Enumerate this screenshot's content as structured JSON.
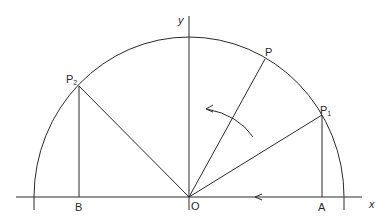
{
  "diagram": {
    "type": "unit-circle-rotation",
    "colors": {
      "line": "#2a2a2a",
      "background": "#ffffff"
    },
    "origin": {
      "label": "O",
      "x": 189,
      "y": 197
    },
    "axes": {
      "x": {
        "label": "x"
      },
      "y": {
        "label": "y"
      }
    },
    "points": {
      "P": {
        "label": "P",
        "x": 265,
        "y": 59
      },
      "P1": {
        "label": "P",
        "subscript": "1",
        "x": 322,
        "y": 115
      },
      "P2": {
        "label": "P",
        "subscript": "2",
        "x": 79,
        "y": 86
      },
      "A": {
        "label": "A",
        "x": 322,
        "y": 197
      },
      "B": {
        "label": "B",
        "x": 79,
        "y": 197
      }
    },
    "arrows": [
      {
        "name": "axis-direction-arrow",
        "direction": "left"
      },
      {
        "name": "rotation-arrow",
        "direction": "counterclockwise"
      }
    ]
  }
}
